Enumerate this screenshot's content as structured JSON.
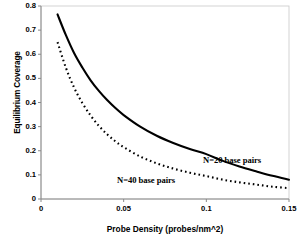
{
  "chart_data": {
    "type": "line",
    "title": "",
    "xlabel": "Probe Density (probes/nm^2)",
    "ylabel": "Equilibrium Coverage",
    "xlim": [
      0,
      0.15
    ],
    "ylim": [
      0,
      0.8
    ],
    "xticks": [
      "0",
      "0.05",
      "0.1",
      "0.15"
    ],
    "xtick_values": [
      0,
      0.05,
      0.1,
      0.15
    ],
    "yticks": [
      "0",
      "0.1",
      "0.2",
      "0.3",
      "0.4",
      "0.5",
      "0.6",
      "0.7",
      "0.8"
    ],
    "ytick_values": [
      0,
      0.1,
      0.2,
      0.3,
      0.4,
      0.5,
      0.6,
      0.7,
      0.8
    ],
    "grid": false,
    "legend_position": "inline-annotations",
    "series": [
      {
        "name": "N=20 base pairs",
        "style": "solid",
        "color": "#000000",
        "annotation": "N=20 base pairs",
        "x": [
          0.01,
          0.015,
          0.02,
          0.025,
          0.03,
          0.035,
          0.04,
          0.045,
          0.05,
          0.06,
          0.07,
          0.08,
          0.09,
          0.1,
          0.11,
          0.12,
          0.13,
          0.14,
          0.15
        ],
        "y": [
          0.765,
          0.68,
          0.605,
          0.545,
          0.492,
          0.448,
          0.41,
          0.377,
          0.348,
          0.3,
          0.262,
          0.232,
          0.207,
          0.186,
          0.158,
          0.135,
          0.115,
          0.096,
          0.08
        ]
      },
      {
        "name": "N=40 base pairs",
        "style": "dotted",
        "color": "#000000",
        "annotation": "N=40 base pairs",
        "x": [
          0.01,
          0.015,
          0.02,
          0.025,
          0.03,
          0.035,
          0.04,
          0.045,
          0.05,
          0.06,
          0.07,
          0.08,
          0.09,
          0.1,
          0.11,
          0.12,
          0.13,
          0.14,
          0.15
        ],
        "y": [
          0.65,
          0.545,
          0.462,
          0.398,
          0.346,
          0.303,
          0.268,
          0.239,
          0.215,
          0.176,
          0.148,
          0.126,
          0.109,
          0.095,
          0.08,
          0.069,
          0.06,
          0.051,
          0.045
        ]
      }
    ],
    "axis": {
      "color": "#808080",
      "plot_left_px": 41,
      "plot_right_px": 289,
      "plot_top_px": 6,
      "plot_bottom_px": 199
    }
  }
}
